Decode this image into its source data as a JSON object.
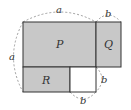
{
  "diagram": {
    "labels": {
      "P": "P",
      "Q": "Q",
      "R": "R",
      "top_a": "a",
      "left_a": "a",
      "top_b": "b",
      "right_b": "b",
      "bottom_b": "b"
    },
    "colors": {
      "shaded": "#c8c8c8",
      "blank": "#ffffff",
      "stroke": "#333333",
      "dashed": "#888888"
    }
  }
}
